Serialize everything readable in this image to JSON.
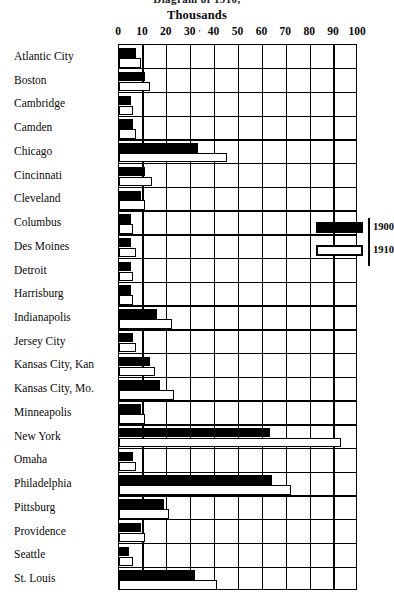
{
  "figure": {
    "clipped_title": "Diagram of 1910,",
    "subtitle": "Thousands"
  },
  "axis": {
    "label": "Thousands",
    "ticks": [
      0,
      10,
      20,
      30,
      40,
      50,
      60,
      70,
      80,
      90,
      100
    ],
    "tick_labels": [
      "0",
      "10",
      "20",
      "30",
      "40",
      "50",
      "60",
      "70",
      "80",
      "90",
      "100"
    ],
    "extra_mark": "'",
    "min": 0,
    "max": 100
  },
  "legend": {
    "items": [
      {
        "label": "1900",
        "style": "filled"
      },
      {
        "label": "1910",
        "style": "outlined"
      }
    ]
  },
  "chart_data": {
    "type": "bar",
    "orientation": "horizontal",
    "title": "Thousands",
    "xlabel": "Thousands",
    "ylabel": "",
    "xlim": [
      0,
      100
    ],
    "grid": true,
    "legend_position": "right-inside",
    "categories": [
      "Atlantic City",
      "Boston",
      "Cambridge",
      "Camden",
      "Chicago",
      "Cincinnati",
      "Cleveland",
      "Columbus",
      "Des Moines",
      "Detroit",
      "Harrisburg",
      "Indianapolis",
      "Jersey City",
      "Kansas City, Kan",
      "Kansas City, Mo.",
      "Minneapolis",
      "New York",
      "Omaha",
      "Philadelphia",
      "Pittsburg",
      "Providence",
      "Seattle",
      "St. Louis"
    ],
    "series": [
      {
        "name": "1900",
        "style": "filled",
        "values": [
          7,
          11,
          5,
          6,
          33,
          11,
          9,
          5,
          5,
          5,
          5,
          16,
          6,
          13,
          17,
          9,
          63,
          6,
          64,
          19,
          9,
          4,
          32
        ]
      },
      {
        "name": "1910",
        "style": "outlined",
        "values": [
          9,
          13,
          6,
          7,
          45,
          14,
          11,
          6,
          7,
          6,
          6,
          22,
          7,
          15,
          23,
          11,
          93,
          7,
          72,
          21,
          11,
          6,
          41
        ]
      }
    ]
  }
}
